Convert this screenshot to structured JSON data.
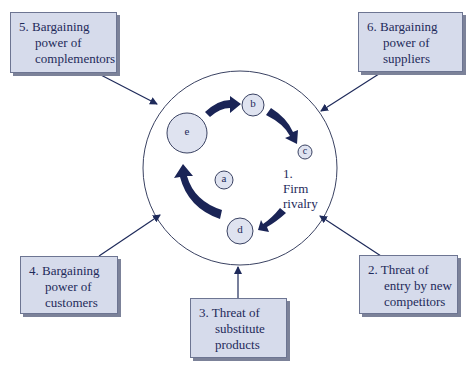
{
  "diagram": {
    "center": {
      "label_number": "1.",
      "label_line1": "Firm",
      "label_line2": "rivalry",
      "nodes": [
        {
          "id": "a",
          "label": "a"
        },
        {
          "id": "b",
          "label": "b"
        },
        {
          "id": "c",
          "label": "c"
        },
        {
          "id": "d",
          "label": "d"
        },
        {
          "id": "e",
          "label": "e"
        }
      ],
      "cycle": [
        "e",
        "b",
        "c",
        "d",
        "e"
      ]
    },
    "forces": [
      {
        "id": "f2",
        "lines": [
          "2. Threat of",
          "entry by new",
          "competitors"
        ]
      },
      {
        "id": "f3",
        "lines": [
          "3. Threat of",
          "substitute",
          "products"
        ]
      },
      {
        "id": "f4",
        "lines": [
          "4. Bargaining",
          "power of",
          "customers"
        ]
      },
      {
        "id": "f5",
        "lines": [
          "5. Bargaining",
          "power of",
          "complementors"
        ]
      },
      {
        "id": "f6",
        "lines": [
          "6. Bargaining",
          "power of",
          "suppliers"
        ]
      }
    ],
    "colors": {
      "box_fill": "#d6dbeb",
      "box_border": "#6d7592",
      "arrow_dark": "#1a2456",
      "node_fill": "#dfe3f0",
      "text": "#1e2a5a"
    }
  }
}
